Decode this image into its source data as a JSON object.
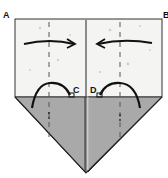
{
  "diagram": {
    "type": "origami-fold-step",
    "labels": {
      "a": "A",
      "b": "B",
      "c": "C",
      "d": "D"
    },
    "colors": {
      "paper": "#f4f4f2",
      "flap": "#a9a9a9",
      "line": "#222222",
      "dash": "#555555"
    },
    "arrows": [
      {
        "name": "fold-arrow-left",
        "direction": "right"
      },
      {
        "name": "fold-arrow-right",
        "direction": "left"
      }
    ]
  }
}
